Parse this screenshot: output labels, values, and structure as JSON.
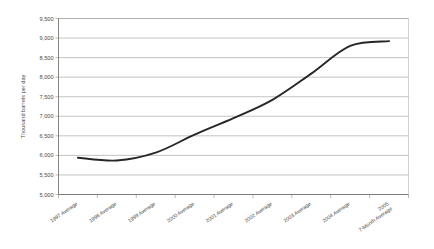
{
  "chart_data": {
    "type": "line",
    "title": "",
    "subtitle": "",
    "xlabel": "",
    "ylabel": "Thousand barrels per day",
    "categories": [
      "1997 Average",
      "1998 Average",
      "1999 Average",
      "2000 Average",
      "2001 Average",
      "2002 Average",
      "2003 Average",
      "2004 Average",
      "2005\n7-Month Average"
    ],
    "category_labels": [
      {
        "line1": "1997 Average",
        "line2": ""
      },
      {
        "line1": "1998 Average",
        "line2": ""
      },
      {
        "line1": "1999 Average",
        "line2": ""
      },
      {
        "line1": "2000 Average",
        "line2": ""
      },
      {
        "line1": "2001 Average",
        "line2": ""
      },
      {
        "line1": "2002 Average",
        "line2": ""
      },
      {
        "line1": "2003 Average",
        "line2": ""
      },
      {
        "line1": "2004 Average",
        "line2": ""
      },
      {
        "line1": "2005",
        "line2": "7-Month Average"
      }
    ],
    "values": [
      5940,
      5870,
      6070,
      6530,
      6950,
      7420,
      8090,
      8800,
      8920
    ],
    "series": [
      {
        "name": "Thousand barrels per day",
        "values": [
          5940,
          5870,
          6070,
          6530,
          6950,
          7420,
          8090,
          8800,
          8920
        ]
      }
    ],
    "ylim": [
      5000,
      9500
    ],
    "ytick_step": 500,
    "ytick_labels": [
      "5,000",
      "5,500",
      "6,000",
      "6,500",
      "7,000",
      "7,500",
      "8,000",
      "8,500",
      "9,000",
      "9,500"
    ],
    "ytick_values": [
      5000,
      5500,
      6000,
      6500,
      7000,
      7500,
      8000,
      8500,
      9000,
      9500
    ],
    "grid": "horizontal",
    "legend": "none",
    "smoothed": true,
    "line_color": "#262626",
    "grid_color": "#9a9a9a",
    "axis_color": "#6e6e6e",
    "background_color": "#ffffff"
  }
}
